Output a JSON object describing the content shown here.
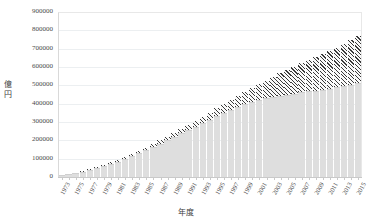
{
  "chart_data": {
    "type": "bar",
    "stacked": true,
    "title": "",
    "xlabel": "年度",
    "ylabel": "億円",
    "ylim": [
      0,
      900000
    ],
    "ytick_step": 100000,
    "yticks": [
      "900000",
      "800000",
      "700000",
      "600000",
      "500000",
      "400000",
      "300000",
      "200000",
      "100000",
      "0"
    ],
    "grid": true,
    "legend": "none",
    "xtick_interval": 2,
    "xtick_labels": [
      "1973",
      "1975",
      "1977",
      "1979",
      "1981",
      "1983",
      "1985",
      "1987",
      "1989",
      "1991",
      "1993",
      "1995",
      "1997",
      "1999",
      "2001",
      "2003",
      "2005",
      "2007",
      "2009",
      "2011",
      "2013",
      "2015"
    ],
    "categories": [
      "1973",
      "1974",
      "1975",
      "1976",
      "1977",
      "1978",
      "1979",
      "1980",
      "1981",
      "1982",
      "1983",
      "1984",
      "1985",
      "1986",
      "1987",
      "1988",
      "1989",
      "1990",
      "1991",
      "1992",
      "1993",
      "1994",
      "1995",
      "1996",
      "1997",
      "1998",
      "1999",
      "2000",
      "2001",
      "2002",
      "2003",
      "2004",
      "2005",
      "2006",
      "2007",
      "2008",
      "2009",
      "2010",
      "2011",
      "2012",
      "2013",
      "2014",
      "2015"
    ],
    "series": [
      {
        "name": "下段系列",
        "color": "#dedede",
        "pattern": "solid",
        "values": [
          3000,
          9000,
          16000,
          24000,
          33000,
          43000,
          54000,
          66000,
          79000,
          93000,
          108000,
          124000,
          141000,
          158000,
          176000,
          194000,
          213000,
          232000,
          251000,
          270000,
          289000,
          308000,
          327000,
          345000,
          362000,
          378000,
          392000,
          404000,
          414000,
          423000,
          431000,
          438000,
          444000,
          450000,
          456000,
          461000,
          466000,
          471000,
          477000,
          483000,
          490000,
          497000,
          505000
        ]
      },
      {
        "name": "上段系列",
        "color": "#3a3a3a",
        "pattern": "diagonal-hatch",
        "values": [
          1000,
          2000,
          3000,
          4000,
          5000,
          6000,
          7000,
          8000,
          9000,
          10000,
          11000,
          12000,
          14000,
          16000,
          18000,
          20000,
          22000,
          25000,
          28000,
          31000,
          34000,
          38000,
          42000,
          47000,
          53000,
          60000,
          68000,
          77000,
          87000,
          98000,
          110000,
          122000,
          134000,
          146000,
          158000,
          170000,
          182000,
          194000,
          206000,
          218000,
          230000,
          244000,
          258000
        ]
      }
    ]
  }
}
